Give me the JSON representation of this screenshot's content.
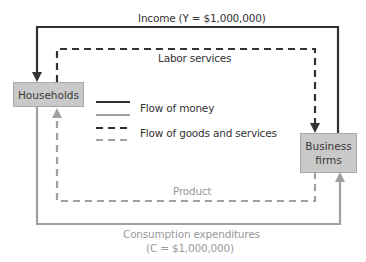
{
  "nodes": {
    "households": "Households",
    "business_firms_line1": "Business",
    "business_firms_line2": "firms"
  },
  "flows": {
    "income": {
      "label": "Income (Y = $1,000,000)",
      "type": "money",
      "direction": "business firms to households"
    },
    "labor": {
      "label": "Labor services",
      "type": "goods",
      "direction": "households to business firms"
    },
    "product": {
      "label": "Product",
      "type": "goods",
      "direction": "business firms to households"
    },
    "consumption": {
      "label_line1": "Consumption expenditures",
      "label_line2": "(C = $1,000,000)",
      "type": "money",
      "direction": "households to business firms"
    }
  },
  "legend": {
    "money": "Flow of money",
    "goods": "Flow of goods and services"
  },
  "colors": {
    "dark": "#333333",
    "gray": "#a0a0a0",
    "box_fill": "#c9c9c9"
  }
}
